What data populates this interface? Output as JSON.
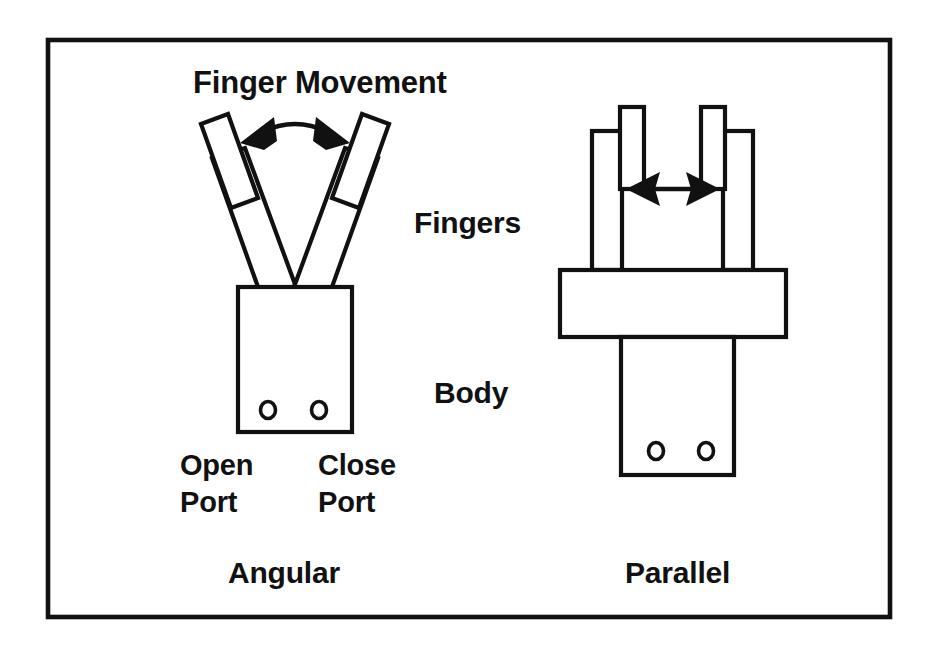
{
  "figure": {
    "title_label": "Finger Movement",
    "part_labels": {
      "fingers": "Fingers",
      "body": "Body"
    },
    "captions": {
      "left": "Angular",
      "right": "Parallel"
    },
    "ports": {
      "open_line1": "Open",
      "open_line2": "Port",
      "close_line1": "Close",
      "close_line2": "Port"
    },
    "colors": {
      "ink": "#111111",
      "paper": "#ffffff"
    },
    "icons": {
      "angular_arrow": "curved-double-arrow-icon",
      "parallel_arrow": "horizontal-double-arrow-icon"
    }
  }
}
